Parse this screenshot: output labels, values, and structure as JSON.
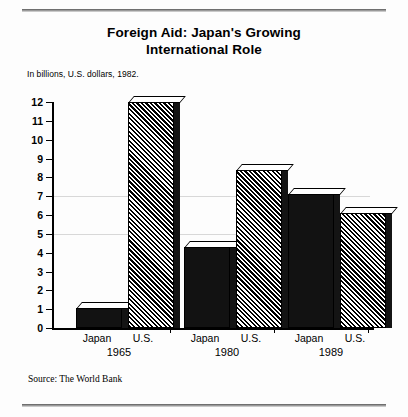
{
  "title": "Foreign Aid: Japan's Growing International Role",
  "title_line1": "Foreign Aid: Japan's Growing",
  "title_line2": "International Role",
  "subtitle": "In billions, U.S. dollars, 1982.",
  "source": "Source: The World Bank",
  "chart_data": {
    "type": "bar",
    "title": "Foreign Aid: Japan's Growing International Role",
    "subtitle": "In billions, U.S. dollars, 1982.",
    "xlabel": "",
    "ylabel": "",
    "ylim": [
      0,
      12
    ],
    "ytick_labels": [
      "0",
      "1",
      "2",
      "3",
      "4",
      "5",
      "6",
      "7",
      "8",
      "9",
      "10",
      "11",
      "12"
    ],
    "yticks": [
      0,
      1,
      2,
      3,
      4,
      5,
      6,
      7,
      8,
      9,
      10,
      11,
      12
    ],
    "grid": false,
    "legend": "none",
    "categories": [
      "1965",
      "1980",
      "1989"
    ],
    "series": [
      {
        "name": "Japan",
        "fill": "solid",
        "values": [
          1.05,
          4.3,
          7.1
        ]
      },
      {
        "name": "U.S.",
        "fill": "hatched",
        "values": [
          12.0,
          8.4,
          6.1
        ]
      }
    ],
    "bar_labels": [
      "Japan",
      "U.S."
    ],
    "source": "Source: The World Bank",
    "units": "billions of U.S. dollars (1982)"
  },
  "groups": [
    {
      "year": "1965",
      "japan_label": "Japan",
      "us_label": "U.S."
    },
    {
      "year": "1980",
      "japan_label": "Japan",
      "us_label": "U.S."
    },
    {
      "year": "1989",
      "japan_label": "Japan",
      "us_label": "U.S."
    }
  ]
}
